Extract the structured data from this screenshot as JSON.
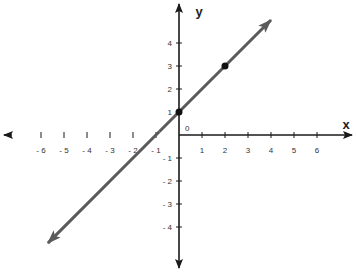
{
  "chart_data": {
    "type": "line",
    "title": "",
    "xlabel": "x",
    "ylabel": "y",
    "xlim": [
      -7.7,
      7.6
    ],
    "ylim": [
      -5.7,
      5.6
    ],
    "grid": false,
    "origin_label": "0",
    "x_ticks": [
      -6,
      -5,
      -4,
      -3,
      -2,
      -1,
      1,
      2,
      3,
      4,
      5,
      6
    ],
    "x_tick_labels": [
      "- 6",
      "- 5",
      "- 4",
      "- 3",
      "- 2",
      "- 1",
      "1",
      "2",
      "3",
      "4",
      "5",
      "6"
    ],
    "y_ticks": [
      4,
      3,
      2,
      1,
      -1,
      -2,
      -3,
      -4
    ],
    "y_tick_labels": [
      "4",
      "3",
      "2",
      "1",
      "- 1",
      "- 2",
      "- 3",
      "- 4"
    ],
    "series": [
      {
        "name": "y = x + 1",
        "equation": "y = x + 1",
        "slope": 1,
        "intercept": 1,
        "x_range": [
          -5.7,
          4.0
        ],
        "color": "#5a5a5a",
        "arrows_both_ends": true
      }
    ],
    "points": [
      {
        "x": 0,
        "y": 1,
        "label": ""
      },
      {
        "x": 2,
        "y": 3,
        "label": ""
      }
    ]
  },
  "colors": {
    "axis": "#1a1a1a",
    "line": "#5a5a5a",
    "point": "#111111",
    "background": "#ffffff"
  }
}
